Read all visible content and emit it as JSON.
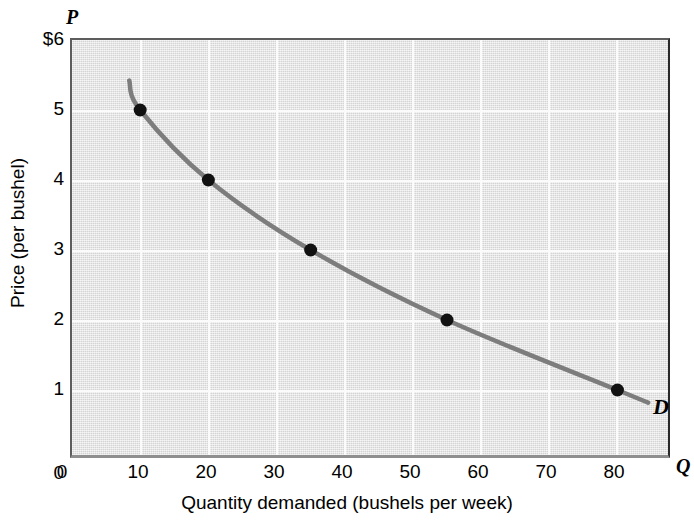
{
  "chart_data": {
    "type": "line",
    "title": "",
    "xlabel": "Quantity demanded (bushels per week)",
    "ylabel": "Price (per bushel)",
    "x_axis_symbol": "Q",
    "y_axis_symbol": "P",
    "xlim": [
      0,
      88
    ],
    "ylim": [
      0,
      6
    ],
    "x_ticks": [
      {
        "value": 0,
        "label": "0"
      },
      {
        "value": 10,
        "label": "10"
      },
      {
        "value": 20,
        "label": "20"
      },
      {
        "value": 30,
        "label": "30"
      },
      {
        "value": 40,
        "label": "40"
      },
      {
        "value": 50,
        "label": "50"
      },
      {
        "value": 60,
        "label": "60"
      },
      {
        "value": 70,
        "label": "70"
      },
      {
        "value": 80,
        "label": "80"
      }
    ],
    "y_ticks": [
      {
        "value": 0,
        "label": "0"
      },
      {
        "value": 1,
        "label": "1"
      },
      {
        "value": 2,
        "label": "2"
      },
      {
        "value": 3,
        "label": "3"
      },
      {
        "value": 4,
        "label": "4"
      },
      {
        "value": 5,
        "label": "5"
      },
      {
        "value": 6,
        "label": "$6"
      }
    ],
    "grid": true,
    "gridlines_x": [
      10,
      20,
      30,
      40,
      50,
      60,
      70,
      80
    ],
    "gridlines_y": [
      1,
      2,
      3,
      4,
      5
    ],
    "legend_position": "none",
    "series": [
      {
        "name": "D",
        "label": "D",
        "color": "#7d7d7d",
        "marker": "circle",
        "marker_color": "#111111",
        "x": [
          10,
          20,
          35,
          55,
          80
        ],
        "y": [
          5,
          4,
          3,
          2,
          1
        ],
        "curve_extends_from": {
          "x": 8.4,
          "y": 5.42
        },
        "curve_extends_to": {
          "x": 84.5,
          "y": 0.82
        }
      }
    ],
    "annotations": [
      {
        "text": "D",
        "x": 85.5,
        "y": 0.72,
        "style": "bold-italic"
      }
    ],
    "colors": {
      "plot_background": "#e4e4e4",
      "gridline": "#fbfbfb",
      "curve": "#7d7d7d",
      "point": "#111111",
      "text": "#000000",
      "page_background": "#ffffff"
    }
  }
}
